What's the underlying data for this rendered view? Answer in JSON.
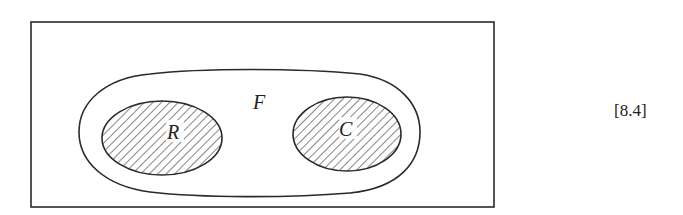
{
  "figure": {
    "type": "venn-diagram",
    "universe_box": true,
    "sets": [
      {
        "label": "F",
        "role": "outer-enclosing-set",
        "shaded": false
      },
      {
        "label": "R",
        "role": "inner-subset-left",
        "shaded": true,
        "pattern": "diagonal-hatch"
      },
      {
        "label": "C",
        "role": "inner-subset-right",
        "shaded": true,
        "pattern": "diagonal-hatch"
      }
    ],
    "labels": {
      "outer": "F",
      "left_subset": "R",
      "right_subset": "C"
    },
    "equation_number": "[8.4]",
    "colors": {
      "stroke": "#2a2a2a",
      "hatch": "#333333",
      "background": "#ffffff"
    }
  }
}
